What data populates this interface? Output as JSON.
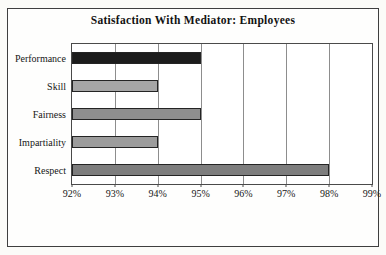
{
  "chart_data": {
    "type": "bar",
    "orientation": "horizontal",
    "title": "Satisfaction With Mediator: Employees",
    "categories": [
      "Performance",
      "Skill",
      "Fairness",
      "Impartiality",
      "Respect"
    ],
    "values": [
      95,
      94,
      95,
      94,
      98
    ],
    "value_unit": "%",
    "xlabel": "",
    "ylabel": "",
    "xlim": [
      92,
      99
    ],
    "x_tick_values": [
      92,
      93,
      94,
      95,
      96,
      97,
      98,
      99
    ],
    "x_tick_labels": [
      "92%",
      "93%",
      "94%",
      "95%",
      "96%",
      "97%",
      "98%",
      "99%"
    ],
    "grid": true,
    "legend": false,
    "colors": {
      "bar_fills": [
        "#1c1c1c",
        "#a6a6a6",
        "#8f8f8f",
        "#9c9c9c",
        "#7d7d7d"
      ],
      "bar_border": "#242424",
      "gridline": "#8d8d8d",
      "plot_border": "#4a4a4a",
      "frame_border": "#3f3f3f",
      "text": "#161616",
      "background": "#fefefd"
    }
  }
}
